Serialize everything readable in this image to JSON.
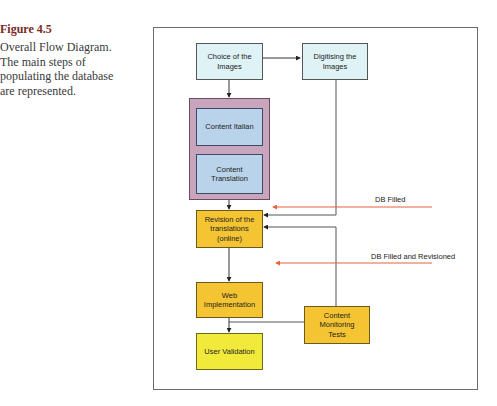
{
  "caption": {
    "figure_label": "Figure 4.5",
    "text_lines": [
      "Overall Flow Diagram.",
      "The main steps of",
      "populating the database",
      "are represented."
    ]
  },
  "diagram": {
    "nodes": {
      "choice": {
        "label_lines": [
          "Choice of the",
          "Images"
        ],
        "color": "#dff2f6"
      },
      "digitising": {
        "label_lines": [
          "Digitising the",
          "Images"
        ],
        "color": "#dff2f6"
      },
      "content_group": {
        "color": "#c8a4bd"
      },
      "content_italian": {
        "label": "Content Italian",
        "color": "#b9d3ea"
      },
      "content_translation": {
        "label_lines": [
          "Content",
          "Translation"
        ],
        "color": "#b9d3ea"
      },
      "revision": {
        "label_lines": [
          "Revision of the",
          "translations",
          "(online)"
        ],
        "color": "#f5c432"
      },
      "web_impl": {
        "label_lines": [
          "Web",
          "Implementation"
        ],
        "color": "#f5c432"
      },
      "monitoring": {
        "label_lines": [
          "Content",
          "Monitoring",
          "Tests"
        ],
        "color": "#f5c432"
      },
      "user_validation": {
        "label": "User Validation",
        "color": "#f2ea3b"
      }
    },
    "annotations": {
      "db_filled": "DB Filled",
      "db_filled_revisioned": "DB Filled and Revisioned"
    },
    "edges": [
      {
        "from": "choice",
        "to": "digitising"
      },
      {
        "from": "choice",
        "to": "content_group"
      },
      {
        "from": "content_italian",
        "to": "content_translation"
      },
      {
        "from": "content_group",
        "to": "revision"
      },
      {
        "from": "digitising",
        "to": "revision"
      },
      {
        "from": "monitoring",
        "to": "revision"
      },
      {
        "from": "revision",
        "to": "web_impl"
      },
      {
        "from": "web_impl",
        "to": "user_validation"
      },
      {
        "from": "monitoring",
        "to": "web_impl_line"
      }
    ],
    "accent_colors": {
      "red_arrow": "#e8603c",
      "line": "#555555"
    }
  }
}
